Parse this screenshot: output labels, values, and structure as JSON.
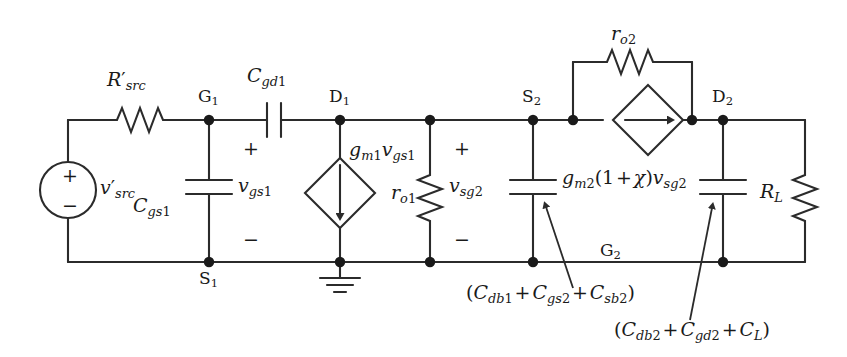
{
  "figure": {
    "type": "small-signal-equivalent-circuit-schematic",
    "line_color": "#2b2b2b",
    "text_color": "#1a1a1a",
    "background": "#ffffff"
  },
  "labels": {
    "r_src": "R′src",
    "v_src": "v′src",
    "c_gs1": "Cgs1",
    "c_gd1": "Cgd1",
    "v_gs1": "vgs1",
    "gm1_vgs1": "gm1vgs1",
    "r_o1": "ro1",
    "v_sg2": "vsg2",
    "gm2_term": "gm2(1 + χ)vsg2",
    "r_o2": "ro2",
    "r_l": "RL",
    "cap_group_1": "(Cdb1 + Cgs2 + Csb2)",
    "cap_group_2": "(Cdb2 + Cgd2 + CL)"
  },
  "nodes": {
    "g1": "G1",
    "d1": "D1",
    "s1": "S1",
    "s2": "S2",
    "g2": "G2",
    "d2": "D2"
  },
  "polarity": {
    "plus": "+",
    "minus": "−"
  },
  "source_polarity": {
    "plus": "+",
    "minus": "−"
  }
}
